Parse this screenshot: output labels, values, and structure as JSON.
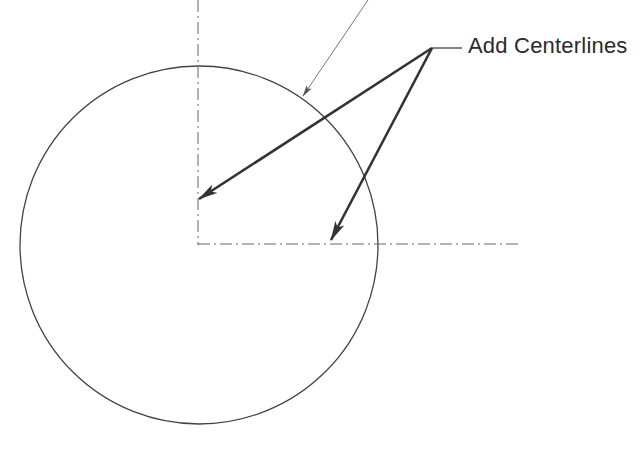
{
  "diagram": {
    "callout_label": "Add Centerlines",
    "colors": {
      "background": "#ffffff",
      "stroke": "#333333",
      "thin_stroke": "#6a6a6a",
      "text": "#2a2a2a"
    },
    "circle": {
      "cx": 199,
      "cy": 245,
      "r": 179
    },
    "centerlines": {
      "vertical": {
        "x": 198,
        "y1": 0,
        "y2": 245
      },
      "horizontal": {
        "y": 244,
        "x1": 198,
        "x2": 522
      }
    },
    "leaders": {
      "junction": {
        "x": 432,
        "y": 48
      },
      "shoulder_end": {
        "x": 462,
        "y": 48
      },
      "arrow_targets": [
        {
          "x": 199,
          "y": 199
        },
        {
          "x": 331,
          "y": 240
        }
      ],
      "thin_leader": {
        "x1": 368,
        "y1": 0,
        "x2": 303,
        "y2": 96
      }
    }
  }
}
